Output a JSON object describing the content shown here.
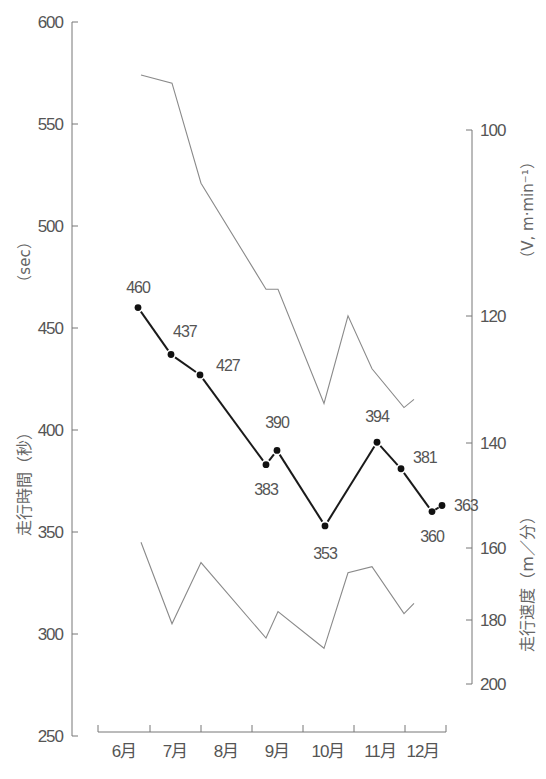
{
  "chart_data": {
    "type": "line",
    "title": "",
    "xlabel": "",
    "ylabel": "走行時間（秒）",
    "ylabel_unit": "（sec）",
    "y2label": "走行速度（m／分）",
    "y2label_unit": "（V, m·min⁻¹）",
    "ylim": [
      250,
      600
    ],
    "y2lim": [
      100,
      200
    ],
    "grid": false,
    "legend": null,
    "x_categories": [
      "6月",
      "7月",
      "8月",
      "9月",
      "10月",
      "11月",
      "12月"
    ],
    "y_ticks": [
      "600",
      "550",
      "500",
      "450",
      "400",
      "350",
      "300",
      "250"
    ],
    "y2_ticks": [
      "100",
      "120",
      "140",
      "160",
      "180",
      "200"
    ],
    "series": [
      {
        "name": "走行時間（平均）",
        "style": "thick-with-markers",
        "values": [
          460,
          437,
          427,
          383,
          390,
          353,
          394,
          381,
          360,
          363
        ],
        "labels": [
          "460",
          "437",
          "427",
          "383",
          "390",
          "353",
          "394",
          "381",
          "360",
          "363"
        ]
      },
      {
        "name": "上限",
        "style": "thin",
        "values": [
          574,
          570,
          521,
          469,
          469,
          413,
          456,
          430,
          411,
          415
        ]
      },
      {
        "name": "下限",
        "style": "thin",
        "values": [
          345,
          305,
          335,
          298,
          311,
          293,
          330,
          333,
          310,
          315
        ]
      }
    ],
    "colors": {
      "axis": "#777777",
      "main_line": "#1a1a1a",
      "thin_line": "#8a8a8a",
      "text": "#555555"
    }
  }
}
